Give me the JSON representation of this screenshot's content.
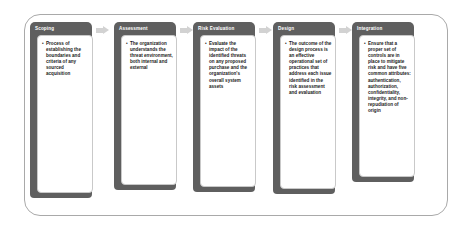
{
  "diagram": {
    "colors": {
      "stage_header_bg": "#5f5f5f",
      "stage_header_text": "#ffffff",
      "card_bg": "#ffffff",
      "card_border": "#c9c9c9",
      "arrow": "#d2d2d2",
      "frame_border": "#a9a9a9",
      "page_bg": "#ffffff",
      "body_text": "#1b1b1b"
    },
    "arrow_icon_name": "right-arrow-icon",
    "stages": [
      {
        "id": "scoping",
        "label": "Scoping",
        "bullets": [
          "Process of establishing the boundaries and criteria of any sourced acquisition"
        ]
      },
      {
        "id": "assessment",
        "label": "Assessment",
        "bullets": [
          "The organization understands the threat environment, both internal and external"
        ]
      },
      {
        "id": "risk-evaluation",
        "label": "Risk Evaluation",
        "bullets": [
          "Evaluate the impact of the identified threats on any proposed purchase and the organization's overall system assets"
        ]
      },
      {
        "id": "design",
        "label": "Design",
        "bullets": [
          "The outcome of the design process is an effective operational set of practices that address each issue identified in the risk assessment and evaluation"
        ]
      },
      {
        "id": "integration",
        "label": "Integration",
        "bullets": [
          "Ensure that a proper set of controls are in place to mitigate risk and have five common attributes: authentication, authorization, confidentiality, integrity, and non-repudiation of origin"
        ]
      }
    ]
  }
}
